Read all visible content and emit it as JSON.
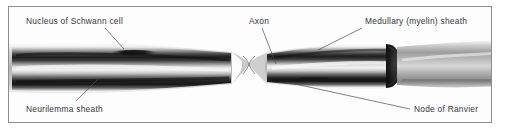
{
  "figure": {
    "frame_color": "#8d8d8d",
    "background_color": "#ffffff",
    "label_color": "#35353a"
  },
  "labels": [
    {
      "id": "nucleus",
      "text": "Nucleus of Schwann cell"
    },
    {
      "id": "axon",
      "text": "Axon"
    },
    {
      "id": "medullary",
      "text": "Medullary (myelin) sheath"
    },
    {
      "id": "neurilemma",
      "text": "Neurilemma sheath"
    },
    {
      "id": "node",
      "text": "Node of Ranvier"
    }
  ],
  "leader_lines": [
    {
      "id": "nucleus",
      "from": [
        105,
        28
      ],
      "to": [
        124,
        49
      ]
    },
    {
      "id": "axon",
      "from": [
        262,
        28
      ],
      "to": [
        276,
        64
      ]
    },
    {
      "id": "medullary",
      "from": [
        362,
        28
      ],
      "to": [
        318,
        50
      ]
    },
    {
      "id": "neurilemma",
      "from": [
        76,
        101
      ],
      "to": [
        99,
        78
      ]
    },
    {
      "id": "node",
      "from": [
        410,
        109
      ],
      "to": [
        286,
        82
      ]
    }
  ],
  "structures": [
    {
      "id": "left-segment",
      "name": "internode-left",
      "description": "myelinated internode left of the node"
    },
    {
      "id": "node",
      "name": "node-of-ranvier",
      "description": "constriction between internodes"
    },
    {
      "id": "right-segment",
      "name": "internode-right",
      "description": "myelinated internode right of the node"
    },
    {
      "id": "cut-end",
      "name": "sheath-cut-end",
      "description": "rounded cut end of the sheath"
    },
    {
      "id": "nucleus-patch",
      "name": "schwann-nucleus",
      "description": "dark elongated Schwann cell nucleus"
    }
  ]
}
